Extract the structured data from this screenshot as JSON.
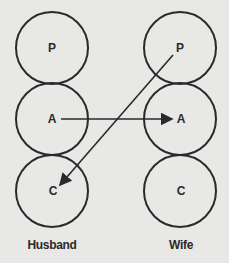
{
  "diagram": {
    "columns": [
      {
        "label": "Husband",
        "states": [
          "P",
          "A",
          "C"
        ]
      },
      {
        "label": "Wife",
        "states": [
          "P",
          "A",
          "C"
        ]
      }
    ],
    "transactions": [
      {
        "from": "Husband A",
        "to": "Wife A"
      },
      {
        "from": "Wife P",
        "to": "Husband C"
      }
    ],
    "colors": {
      "background": "#e8e8e6",
      "stroke": "#2a2a2a"
    }
  }
}
